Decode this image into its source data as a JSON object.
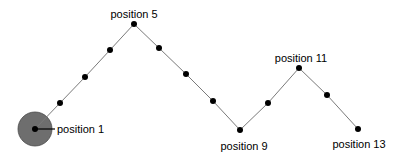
{
  "diagram": {
    "line_color": "#7a7a7a",
    "dot_color": "#000000",
    "highlight": {
      "color": "#6e6e6e",
      "stroke": "#4a4a4a",
      "radius": 17,
      "point": 1
    },
    "points": [
      {
        "n": 1,
        "x": 35,
        "y": 129
      },
      {
        "n": 2,
        "x": 60,
        "y": 103
      },
      {
        "n": 3,
        "x": 85,
        "y": 77
      },
      {
        "n": 4,
        "x": 110,
        "y": 50
      },
      {
        "n": 5,
        "x": 134,
        "y": 24
      },
      {
        "n": 6,
        "x": 159,
        "y": 48
      },
      {
        "n": 7,
        "x": 186,
        "y": 74
      },
      {
        "n": 8,
        "x": 213,
        "y": 101
      },
      {
        "n": 9,
        "x": 240,
        "y": 130
      },
      {
        "n": 10,
        "x": 268,
        "y": 103
      },
      {
        "n": 11,
        "x": 299,
        "y": 68
      },
      {
        "n": 12,
        "x": 327,
        "y": 95
      },
      {
        "n": 13,
        "x": 358,
        "y": 129
      }
    ],
    "labels": [
      {
        "text": "position 1",
        "x": 57,
        "y": 133,
        "anchor": "start"
      },
      {
        "text": "position 5",
        "x": 134,
        "y": 18,
        "anchor": "middle"
      },
      {
        "text": "position 9",
        "x": 244,
        "y": 150,
        "anchor": "middle"
      },
      {
        "text": "position 11",
        "x": 301,
        "y": 62,
        "anchor": "middle"
      },
      {
        "text": "position 13",
        "x": 359,
        "y": 148,
        "anchor": "middle"
      }
    ]
  }
}
